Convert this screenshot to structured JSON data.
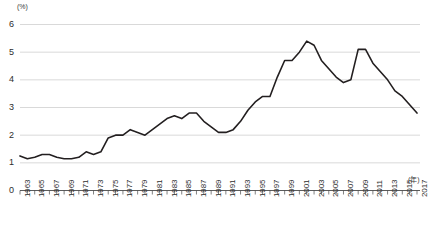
{
  "chart_data": {
    "type": "line",
    "title": "",
    "xlabel": "(年)",
    "ylabel": "(%)",
    "ylim": [
      0,
      6
    ],
    "xlim": [
      1963,
      2017
    ],
    "grid": true,
    "legend": false,
    "y_ticks": [
      "0",
      "1",
      "2",
      "3",
      "4",
      "5",
      "6"
    ],
    "y_tick_values": [
      0,
      1,
      2,
      3,
      4,
      5,
      6
    ],
    "x_tick_labels": [
      "1963",
      "1965",
      "1967",
      "1969",
      "1971",
      "1973",
      "1975",
      "1977",
      "1979",
      "1981",
      "1983",
      "1985",
      "1987",
      "1989",
      "1991",
      "1993",
      "1995",
      "1997",
      "1999",
      "2001",
      "2003",
      "2005",
      "2007",
      "2009",
      "2011",
      "2013",
      "2015",
      "2017"
    ],
    "line_color": "#231f20",
    "line_width": 1.6,
    "x": [
      1963,
      1964,
      1965,
      1966,
      1967,
      1968,
      1969,
      1970,
      1971,
      1972,
      1973,
      1974,
      1975,
      1976,
      1977,
      1978,
      1979,
      1980,
      1981,
      1982,
      1983,
      1984,
      1985,
      1986,
      1987,
      1988,
      1989,
      1990,
      1991,
      1992,
      1993,
      1994,
      1995,
      1996,
      1997,
      1998,
      1999,
      2000,
      2001,
      2002,
      2003,
      2004,
      2005,
      2006,
      2007,
      2008,
      2009,
      2010,
      2011,
      2012,
      2013,
      2014,
      2015,
      2016,
      2017
    ],
    "values": [
      1.25,
      1.15,
      1.2,
      1.3,
      1.3,
      1.2,
      1.15,
      1.15,
      1.2,
      1.4,
      1.3,
      1.4,
      1.9,
      2.0,
      2.0,
      2.2,
      2.1,
      2.0,
      2.2,
      2.4,
      2.6,
      2.7,
      2.6,
      2.8,
      2.8,
      2.5,
      2.3,
      2.1,
      2.1,
      2.2,
      2.5,
      2.9,
      3.2,
      3.4,
      3.4,
      4.1,
      4.7,
      4.7,
      5.0,
      5.4,
      5.25,
      4.7,
      4.4,
      4.1,
      3.9,
      4.0,
      5.1,
      5.1,
      4.6,
      4.3,
      4.0,
      3.6,
      3.4,
      3.1,
      2.8
    ]
  }
}
